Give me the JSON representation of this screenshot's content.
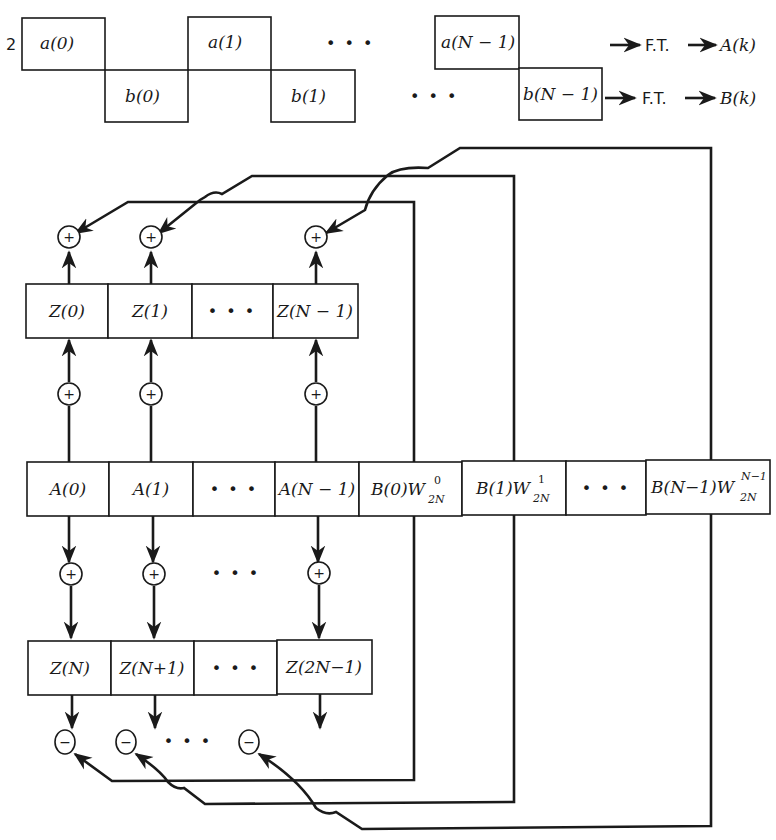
{
  "top_sequence": {
    "scale_factor": "2",
    "a_cells": [
      "a(0)",
      "a(1)",
      "a(N − 1)"
    ],
    "b_cells": [
      "b(0)",
      "b(1)",
      "b(N − 1)"
    ],
    "ellipsis": "• • •",
    "a_output": {
      "op": "F.T.",
      "result": "A(k)"
    },
    "b_output": {
      "op": "F.T.",
      "result": "B(k)"
    }
  },
  "z_low_row": {
    "cells": [
      "Z(0)",
      "Z(1)",
      "• • •",
      "Z(N − 1)"
    ]
  },
  "ab_row": {
    "cells": [
      "A(0)",
      "A(1)",
      "• • •",
      "A(N − 1)"
    ],
    "b_cells": [
      {
        "base": "B(0)W",
        "sup": "0",
        "sub": "2N"
      },
      {
        "base": "B(1)W",
        "sup": "1",
        "sub": "2N"
      },
      {
        "base": "• • •",
        "sup": "",
        "sub": ""
      },
      {
        "base": "B(N−1)W",
        "sup": "N−1",
        "sub": "2N"
      }
    ]
  },
  "z_high_row": {
    "cells": [
      "Z(N)",
      "Z(N+1)",
      "• • •",
      "Z(2N−1)"
    ]
  },
  "nodes": {
    "plus": "+",
    "minus": "−",
    "ellipsis": "• • •"
  }
}
